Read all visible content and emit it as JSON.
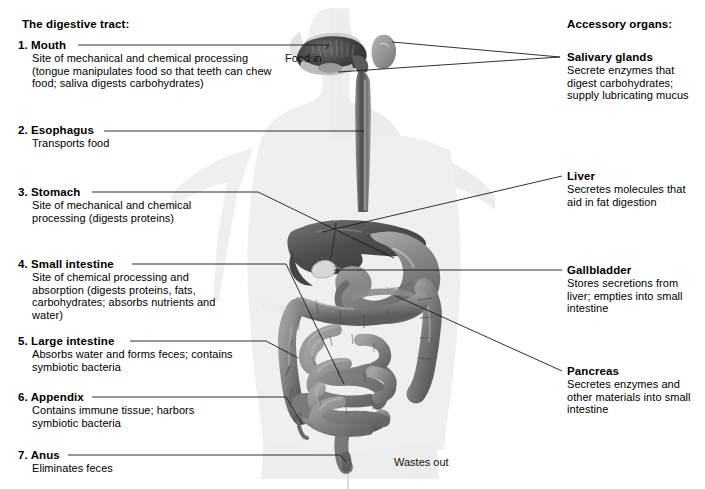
{
  "headings": {
    "left": "The digestive tract:",
    "right": "Accessory organs:"
  },
  "flow": {
    "food_in": "Food in",
    "wastes_out": "Wastes out"
  },
  "colors": {
    "body_silhouette": "#efefef",
    "organ_dark": "#4a4a4a",
    "organ_mid": "#7d7d7d",
    "organ_light": "#a8a8a8",
    "leader_line": "#1a1a1a",
    "text": "#000000",
    "background": "#ffffff"
  },
  "tract": [
    {
      "number": "1.",
      "title": "Mouth",
      "desc": "Site of mechanical and chemical processing (tongue manipulates food so that teeth can chew food; saliva digests carbohydrates)"
    },
    {
      "number": "2.",
      "title": "Esophagus",
      "desc": "Transports food"
    },
    {
      "number": "3.",
      "title": "Stomach",
      "desc": "Site of mechanical and chemical processing (digests proteins)"
    },
    {
      "number": "4.",
      "title": "Small intestine",
      "desc": "Site of chemical processing and absorption (digests proteins, fats, carbohydrates; absorbs nutrients and water)"
    },
    {
      "number": "5.",
      "title": "Large intestine",
      "desc": "Absorbs water and forms feces; contains symbiotic bacteria"
    },
    {
      "number": "6.",
      "title": "Appendix",
      "desc": "Contains immune tissue; harbors symbiotic bacteria"
    },
    {
      "number": "7.",
      "title": "Anus",
      "desc": "Eliminates feces"
    }
  ],
  "accessory": [
    {
      "title": "Salivary glands",
      "desc": "Secrete enzymes that digest carbohydrates; supply lubricating mucus"
    },
    {
      "title": "Liver",
      "desc": "Secretes molecules that aid in fat digestion"
    },
    {
      "title": "Gallbladder",
      "desc": "Stores secretions from liver; empties into small intestine"
    },
    {
      "title": "Pancreas",
      "desc": "Secretes enzymes and other materials into small intestine"
    }
  ]
}
